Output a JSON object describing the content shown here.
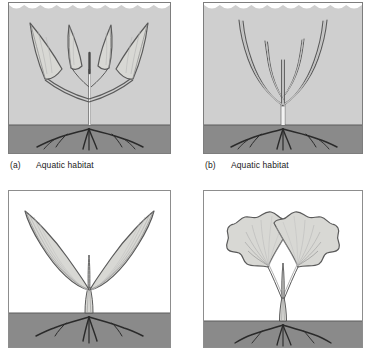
{
  "figure": {
    "colors": {
      "water": "#cfcfcf",
      "soil": "#8a8a8a",
      "soil_line": "#5d5d5d",
      "frame": "#7d7d7d",
      "leaf_fill": "#d8d8d4",
      "leaf_outline": "#5a5a5a",
      "vein": "#8f8f8f",
      "stem": "#f2f2f2",
      "root": "#2a2a2a",
      "background": "#ffffff",
      "caption_text": "#1a1a1a"
    }
  },
  "panels": [
    {
      "id": "a",
      "tag": "(a)",
      "label": "Aquatic habitat",
      "habitat": "aquatic",
      "background": "water",
      "water_surface": "wavy",
      "leaf_shape": "broad lance-shaped leaves",
      "leaf_count": 4,
      "venation": "midrib with fine lateral veins",
      "roots": "fibrous spreading roots in soil"
    },
    {
      "id": "b",
      "tag": "(b)",
      "label": "Aquatic habitat",
      "habitat": "aquatic",
      "background": "water",
      "water_surface": "wavy",
      "leaf_shape": "narrow ribbon-like strap leaves",
      "leaf_count": 5,
      "venation": "single parallel vein",
      "roots": "fibrous spreading roots in soil"
    },
    {
      "id": "c",
      "tag": "",
      "label": "",
      "habitat": "terrestrial",
      "background": "white",
      "water_surface": "none",
      "leaf_shape": "elongate lanceolate leaves",
      "leaf_count": 3,
      "venation": "parallel longitudinal veins",
      "roots": "fibrous spreading roots in soil"
    },
    {
      "id": "d",
      "tag": "",
      "label": "",
      "habitat": "terrestrial",
      "background": "white",
      "water_surface": "none",
      "leaf_shape": "fan-shaped lobed leaves with scalloped margin",
      "leaf_count": 2,
      "venation": "radiating dichotomous veins",
      "roots": "fibrous spreading roots in soil"
    }
  ]
}
